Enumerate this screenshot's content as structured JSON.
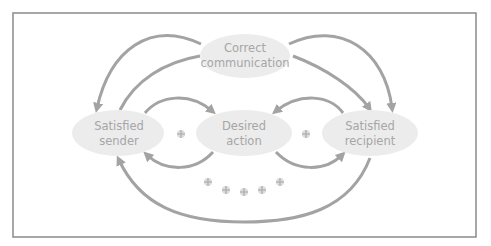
{
  "diagram": {
    "title": "",
    "colors": {
      "frame": "#8a8a8a",
      "node_fill": "#ececec",
      "node_text": "#a6a6a6",
      "arrow": "#a3a3a3",
      "plus": "#b0b0b0"
    },
    "nodes": [
      {
        "id": "correct_communication",
        "line1": "Correct",
        "line2": "communication"
      },
      {
        "id": "satisfied_sender",
        "line1": "Satisfied",
        "line2": "sender"
      },
      {
        "id": "desired_action",
        "line1": "Desired",
        "line2": "action"
      },
      {
        "id": "satisfied_recipient",
        "line1": "Satisfied",
        "line2": "recipient"
      }
    ],
    "edges": [
      {
        "from": "correct_communication",
        "to": "satisfied_sender"
      },
      {
        "from": "satisfied_sender",
        "to": "satisfied_recipient",
        "via": "top"
      },
      {
        "from": "correct_communication",
        "to": "satisfied_recipient"
      },
      {
        "from": "satisfied_recipient",
        "to": "satisfied_sender",
        "via": "top"
      },
      {
        "from": "satisfied_sender",
        "to": "desired_action"
      },
      {
        "from": "desired_action",
        "to": "satisfied_sender"
      },
      {
        "from": "satisfied_recipient",
        "to": "desired_action"
      },
      {
        "from": "desired_action",
        "to": "satisfied_recipient"
      },
      {
        "from": "satisfied_recipient",
        "to": "satisfied_sender",
        "via": "bottom"
      }
    ],
    "plus_markers": {
      "between_nodes": 2,
      "bottom_row": 5
    }
  }
}
